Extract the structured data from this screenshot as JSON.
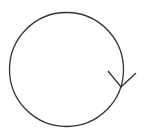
{
  "diagram": {
    "stroke_color": "#333333",
    "background": "#ffffff",
    "circle": {
      "cx": 66.5,
      "cy": 69.5,
      "r": 57
    },
    "arrowhead": {
      "tip": [
        121,
        87
      ],
      "left_arm_end": [
        108,
        71
      ],
      "right_arm_end": [
        136,
        73
      ]
    }
  }
}
